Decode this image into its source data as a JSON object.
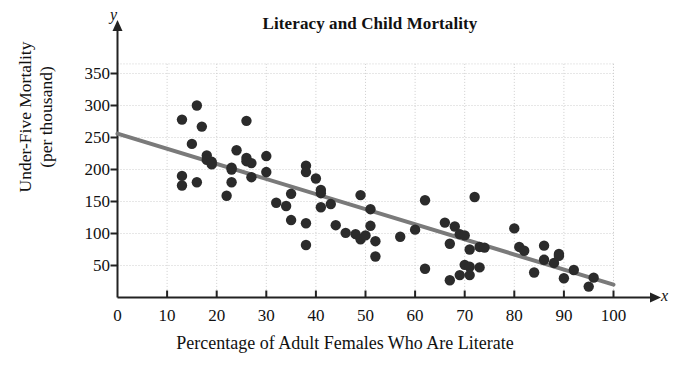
{
  "chart_data": {
    "type": "scatter",
    "title": "Literacy and Child Mortality",
    "xlabel": "Percentage of Adult Females Who Are Literate",
    "ylabel_line1": "Under-Five Mortality",
    "ylabel_line2": "(per thousand)",
    "x_axis_letter": "x",
    "y_axis_letter": "y",
    "xlim": [
      0,
      100
    ],
    "ylim": [
      0,
      365
    ],
    "xticks": [
      0,
      10,
      20,
      30,
      40,
      50,
      60,
      70,
      80,
      90,
      100
    ],
    "yticks": [
      50,
      100,
      150,
      200,
      250,
      300,
      350
    ],
    "xtick_labels": [
      "0",
      "10",
      "20",
      "30",
      "40",
      "50",
      "60",
      "70",
      "80",
      "90",
      "100"
    ],
    "ytick_labels": [
      "50",
      "100",
      "150",
      "200",
      "250",
      "300",
      "350"
    ],
    "grid": true,
    "legend": "none",
    "marker_color": "#2b2b2b",
    "marker_size": 5.2,
    "trendline": {
      "label": "least-squares regression line",
      "color": "#7a7a7a",
      "width": 4,
      "x_start": 0,
      "y_start": 256,
      "x_end": 100,
      "y_end": 20,
      "slope": -2.36,
      "intercept": 256
    },
    "points": [
      [
        13,
        175
      ],
      [
        13,
        190
      ],
      [
        13,
        278
      ],
      [
        15,
        240
      ],
      [
        16,
        300
      ],
      [
        16,
        180
      ],
      [
        17,
        267
      ],
      [
        18,
        222
      ],
      [
        18,
        215
      ],
      [
        19,
        212
      ],
      [
        19,
        208
      ],
      [
        22,
        159
      ],
      [
        23,
        180
      ],
      [
        23,
        203
      ],
      [
        23,
        200
      ],
      [
        24,
        230
      ],
      [
        26,
        276
      ],
      [
        26,
        218
      ],
      [
        26,
        213
      ],
      [
        27,
        210
      ],
      [
        27,
        188
      ],
      [
        30,
        221
      ],
      [
        30,
        196
      ],
      [
        32,
        148
      ],
      [
        34,
        143
      ],
      [
        35,
        162
      ],
      [
        35,
        121
      ],
      [
        38,
        206
      ],
      [
        38,
        196
      ],
      [
        38,
        116
      ],
      [
        38,
        82
      ],
      [
        40,
        186
      ],
      [
        41,
        168
      ],
      [
        41,
        163
      ],
      [
        41,
        141
      ],
      [
        43,
        146
      ],
      [
        44,
        113
      ],
      [
        46,
        101
      ],
      [
        48,
        99
      ],
      [
        49,
        160
      ],
      [
        49,
        91
      ],
      [
        50,
        97
      ],
      [
        51,
        112
      ],
      [
        51,
        138
      ],
      [
        52,
        88
      ],
      [
        52,
        64
      ],
      [
        57,
        95
      ],
      [
        60,
        106
      ],
      [
        62,
        152
      ],
      [
        62,
        45
      ],
      [
        66,
        117
      ],
      [
        67,
        84
      ],
      [
        67,
        27
      ],
      [
        68,
        111
      ],
      [
        69,
        35
      ],
      [
        69,
        99
      ],
      [
        70,
        97
      ],
      [
        70,
        51
      ],
      [
        71,
        75
      ],
      [
        71,
        48
      ],
      [
        71,
        35
      ],
      [
        72,
        157
      ],
      [
        73,
        79
      ],
      [
        73,
        47
      ],
      [
        74,
        78
      ],
      [
        80,
        108
      ],
      [
        81,
        79
      ],
      [
        82,
        73
      ],
      [
        84,
        39
      ],
      [
        86,
        81
      ],
      [
        86,
        59
      ],
      [
        88,
        54
      ],
      [
        89,
        68
      ],
      [
        89,
        65
      ],
      [
        90,
        30
      ],
      [
        92,
        43
      ],
      [
        95,
        17
      ],
      [
        96,
        31
      ]
    ]
  }
}
